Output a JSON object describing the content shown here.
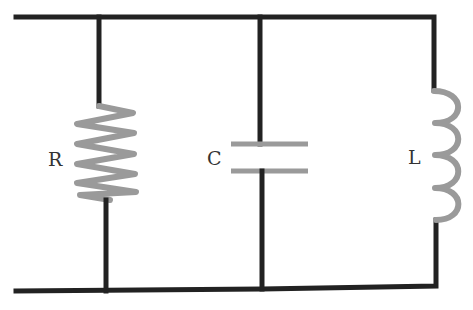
{
  "diagram": {
    "type": "parallel RLC circuit",
    "components": [
      {
        "id": "resistor",
        "label": "R",
        "symbol": "zigzag"
      },
      {
        "id": "capacitor",
        "label": "C",
        "symbol": "parallel-plates"
      },
      {
        "id": "inductor",
        "label": "L",
        "symbol": "coil"
      }
    ],
    "colors": {
      "wire": "#222222",
      "component": "#9a9a9a",
      "label": "#333333",
      "background": "#ffffff"
    }
  }
}
